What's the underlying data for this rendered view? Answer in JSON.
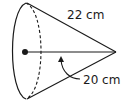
{
  "figure": {
    "shape": "cone",
    "slant_height_label": "22 cm",
    "height_label": "20 cm",
    "stroke_color": "#1a1a1a",
    "background": "#ffffff"
  }
}
